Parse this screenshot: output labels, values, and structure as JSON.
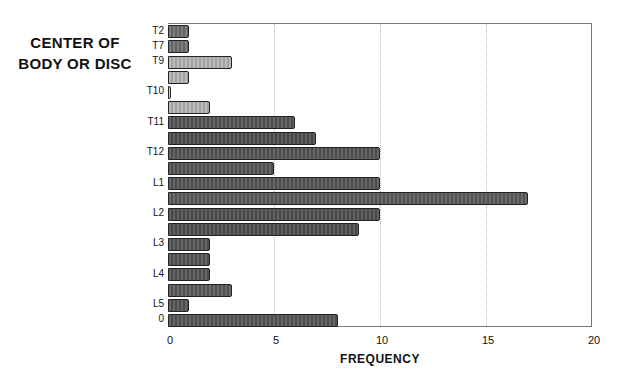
{
  "chart_data": {
    "type": "bar",
    "orientation": "horizontal",
    "title": "",
    "ylabel": "CENTER OF BODY OR DISC",
    "xlabel": "FREQUENCY",
    "xlim": [
      0,
      20
    ],
    "xticks": [
      0,
      5,
      10,
      15,
      20
    ],
    "grid": "vertical dotted at 5, 10, 15",
    "legend": null,
    "categories": [
      "T2",
      "T7",
      "T9",
      "",
      "T10",
      "",
      "T11",
      "",
      "T12",
      "",
      "L1",
      "",
      "L2",
      "",
      "L3",
      "",
      "L4",
      "",
      "L5",
      "0"
    ],
    "values": [
      1,
      1,
      3,
      1,
      0.1,
      2,
      6,
      7,
      10,
      5,
      10,
      17,
      10,
      9,
      2,
      2,
      2,
      3,
      1,
      8
    ],
    "shades": [
      "#6e6e6e",
      "#6e6e6e",
      "#b4b4b4",
      "#b4b4b4",
      "#d0d0d0",
      "#b4b4b4",
      "#555555",
      "#4e4e4e",
      "#555555",
      "#555555",
      "#555555",
      "#5a5a5a",
      "#505050",
      "#4e4e4e",
      "#555555",
      "#555555",
      "#555555",
      "#5a5a5a",
      "#555555",
      "#555555"
    ]
  },
  "labels": {
    "ytitle_line1": "CENTER OF",
    "ytitle_line2": "BODY OR DISC",
    "xtitle": "FREQUENCY"
  }
}
